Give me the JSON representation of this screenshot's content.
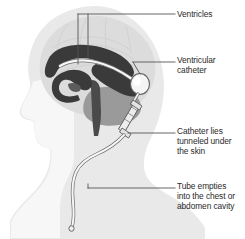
{
  "figure": {
    "kind": "medical-illustration",
    "background_color": "#ffffff",
    "line_color": "#555555",
    "text_color": "#2b2b2b"
  },
  "anatomy": {
    "head_silhouette": {
      "name": "head-profile",
      "fill": "#e9e9e9"
    },
    "face_profile": {
      "name": "face-profile",
      "fill": "#f7f7f7"
    },
    "brain": {
      "name": "brain",
      "fill": "#dcdcdc",
      "texture_color": "#cfcfcf"
    },
    "cerebellum": {
      "name": "cerebellum",
      "fill": "#9a9a9a"
    },
    "brainstem": {
      "name": "brainstem",
      "fill": "#4a4a4a"
    },
    "ventricles": {
      "name": "ventricles",
      "fill": "#3a3a3a"
    }
  },
  "device": {
    "ventricular_catheter": {
      "name": "ventricular-catheter",
      "fill": "#f2f2f2",
      "stroke": "#6d6d6d"
    },
    "reservoir": {
      "name": "shunt-reservoir",
      "fill": "#f4f4f4",
      "stroke": "#5e5e5e"
    },
    "valve": {
      "name": "shunt-valve",
      "fill": "#ededed",
      "stroke": "#5e5e5e"
    },
    "distal_tubing": {
      "name": "distal-tubing",
      "fill": "#f4f4f4",
      "stroke": "#6d6d6d"
    }
  },
  "labels": [
    {
      "id": "ventricles",
      "text": "Ventricles",
      "x": 177,
      "y": 12
    },
    {
      "id": "ventricular-catheter",
      "text": "Ventricular\ncatheter",
      "x": 177,
      "y": 57
    },
    {
      "id": "catheter-tunneled",
      "text": "Catheter lies\ntunneled under\nthe skin",
      "x": 177,
      "y": 128
    },
    {
      "id": "tube-empties",
      "text": "Tube empties\ninto the chest or\nabdomen cavity",
      "x": 177,
      "y": 183
    }
  ],
  "leader_lines": [
    {
      "id": "ventricles-leader",
      "description": "two vertical drops from a horizontal run into the ventricles"
    },
    {
      "id": "ventricular-catheter-leader",
      "description": "horizontal line from reservoir to label"
    },
    {
      "id": "catheter-tunneled-leader",
      "description": "horizontal line from valve to label"
    },
    {
      "id": "tube-empties-leader",
      "description": "horizontal line from distal tubing to label"
    }
  ]
}
